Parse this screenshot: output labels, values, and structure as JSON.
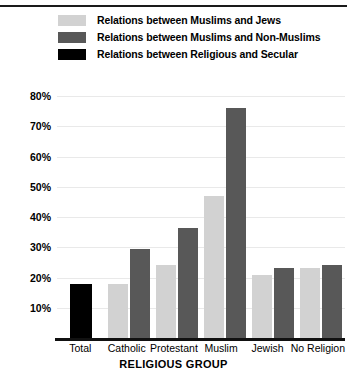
{
  "chart_data": {
    "type": "bar",
    "title": "",
    "xlabel": "RELIGIOUS GROUP",
    "ylabel": "",
    "categories": [
      "Total",
      "Catholic",
      "Protestant",
      "Muslim",
      "Jewish",
      "No Religion"
    ],
    "yticks": [
      "80%",
      "70%",
      "60%",
      "50%",
      "40%",
      "30%",
      "20%",
      "10%"
    ],
    "ytick_values": [
      80,
      70,
      60,
      50,
      40,
      30,
      20,
      10
    ],
    "ylim": [
      0,
      85
    ],
    "grid": true,
    "legend_position": "top-left",
    "series": [
      {
        "name": "Relations between Muslims and Jews",
        "color": "#d2d2d2",
        "values": [
          null,
          18,
          24,
          47,
          21,
          23
        ]
      },
      {
        "name": "Relations between Muslims and Non-Muslims",
        "color": "#585858",
        "values": [
          null,
          29.5,
          36.5,
          76,
          23,
          24
        ]
      },
      {
        "name": "Relations between Religious and Secular",
        "color": "#000000",
        "values": [
          18,
          null,
          null,
          null,
          null,
          null
        ]
      }
    ]
  },
  "legend": {
    "items": [
      {
        "label": "Relations between Muslims and Jews",
        "color": "#d2d2d2"
      },
      {
        "label": "Relations between Muslims and Non-Muslims",
        "color": "#585858"
      },
      {
        "label": "Relations between Religious and Secular",
        "color": "#000000"
      }
    ]
  },
  "axis": {
    "x_title": "RELIGIOUS GROUP"
  }
}
